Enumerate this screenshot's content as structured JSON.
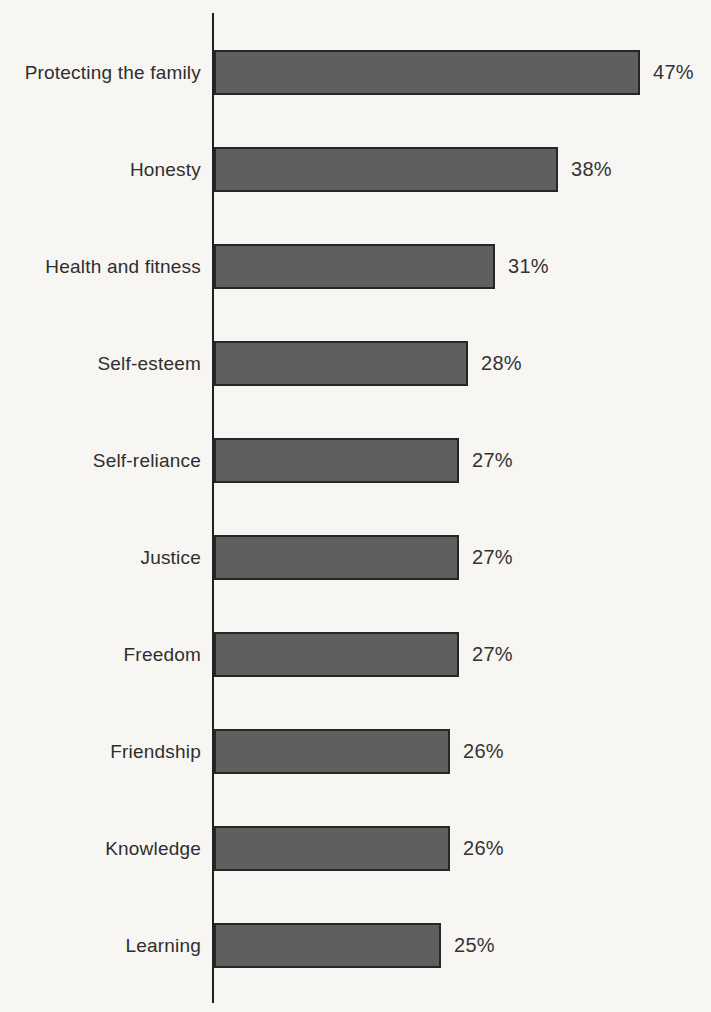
{
  "chart_data": {
    "type": "bar",
    "orientation": "horizontal",
    "title": "",
    "xlabel": "",
    "ylabel": "",
    "categories": [
      "Protecting the family",
      "Honesty",
      "Health and fitness",
      "Self-esteem",
      "Self-reliance",
      "Justice",
      "Freedom",
      "Friendship",
      "Knowledge",
      "Learning"
    ],
    "values": [
      47,
      38,
      31,
      28,
      27,
      27,
      27,
      26,
      26,
      25
    ],
    "value_labels": [
      "47%",
      "38%",
      "31%",
      "28%",
      "27%",
      "27%",
      "27%",
      "26%",
      "26%",
      "25%"
    ],
    "value_suffix": "%",
    "xlim": [
      0,
      50
    ],
    "grid": false,
    "legend": false,
    "colors": {
      "bar_fill": "#5f5f5f",
      "bar_border": "#262626",
      "axis_line": "#1f1f1f",
      "category_text": "#2e2e2e",
      "value_text": "#333333",
      "background": "#f7f6f3"
    }
  }
}
